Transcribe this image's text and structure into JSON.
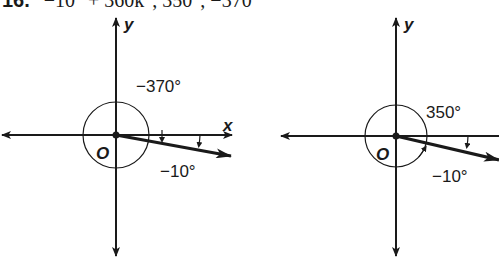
{
  "problem": {
    "number": "16.",
    "expression": "−10° + 360k°, 350°, −370°"
  },
  "diagrams": [
    {
      "name": "negative-370",
      "origin_label": "O",
      "x_axis_label": "x",
      "y_axis_label": "y",
      "angle_label": "−370°",
      "reference_angle_label": "−10°",
      "terminal_angle_deg": -10,
      "rotation_deg": -370,
      "direction": "clockwise"
    },
    {
      "name": "positive-350",
      "origin_label": "O",
      "x_axis_label": "x",
      "y_axis_label": "y",
      "angle_label": "350°",
      "reference_angle_label": "−10°",
      "terminal_angle_deg": -10,
      "rotation_deg": 350,
      "direction": "counterclockwise"
    }
  ],
  "colors": {
    "ink": "#1a1a1a",
    "background": "#ffffff"
  }
}
